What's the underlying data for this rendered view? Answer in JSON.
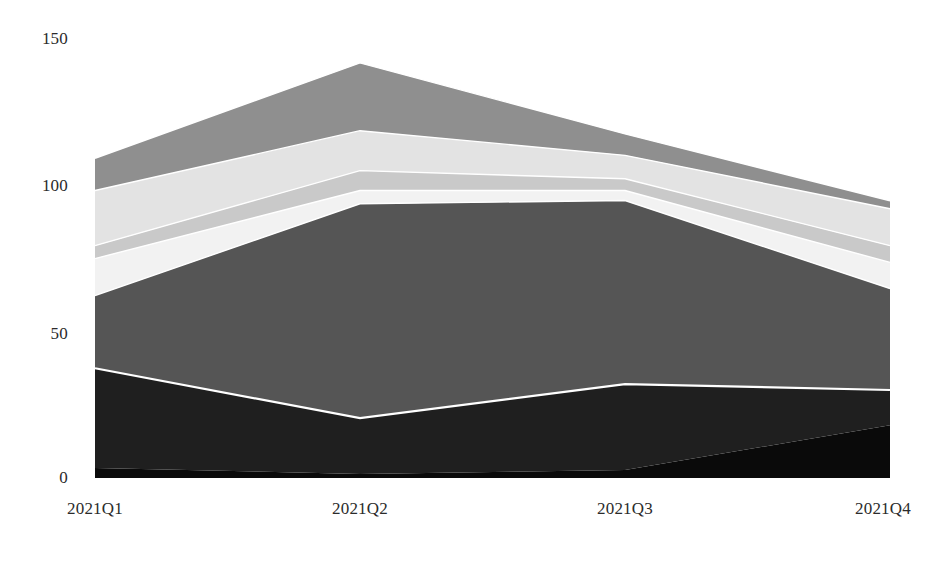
{
  "chart_data": {
    "type": "area",
    "stacked": true,
    "title": "",
    "subtitle": "",
    "xlabel": "",
    "ylabel": "",
    "categories": [
      "2021Q1",
      "2021Q2",
      "2021Q3",
      "2021Q4"
    ],
    "x_tick_labels": [
      "2021Q1",
      "2021Q2",
      "2021Q3",
      "2021Q4"
    ],
    "y_tick_labels": [
      "0",
      "50",
      "100",
      "150"
    ],
    "y_ticks": [
      0,
      50,
      100,
      150
    ],
    "ylim": [
      0,
      150
    ],
    "grid": false,
    "legend": "none",
    "series": [
      {
        "name": "series-1",
        "color": "#0a0a0a",
        "values": [
          3.4,
          1.4,
          2.7,
          18.0
        ]
      },
      {
        "name": "series-2",
        "color": "#1f1f1f",
        "values": [
          34.0,
          19.0,
          29.3,
          12.0
        ]
      },
      {
        "name": "series-3",
        "color": "#555555",
        "values": [
          24.8,
          73.1,
          62.6,
          34.6
        ]
      },
      {
        "name": "series-4",
        "color": "#f2f2f2",
        "values": [
          12.6,
          4.5,
          3.4,
          8.9
        ]
      },
      {
        "name": "series-5",
        "color": "#c9c9c9",
        "values": [
          4.4,
          6.8,
          4.0,
          5.7
        ]
      },
      {
        "name": "series-6",
        "color": "#e3e3e3",
        "values": [
          18.8,
          13.6,
          8.0,
          12.6
        ]
      },
      {
        "name": "series-7",
        "color": "#8f8f8f",
        "values": [
          11.0,
          23.1,
          7.3,
          2.7
        ]
      }
    ],
    "totals": [
      109.0,
      141.5,
      117.3,
      94.5
    ],
    "series_boundaries_cumulative": [
      [
        3.4,
        37.4,
        62.2,
        74.8,
        79.2,
        98.0,
        109.0
      ],
      [
        1.4,
        20.4,
        93.5,
        98.0,
        104.8,
        118.4,
        141.5
      ],
      [
        2.7,
        32.0,
        94.6,
        98.0,
        102.0,
        110.0,
        117.3
      ],
      [
        18.0,
        30.0,
        64.6,
        73.5,
        79.2,
        91.8,
        94.5
      ]
    ],
    "colors": {
      "background": "#ffffff",
      "axis_text": "#2b2b2b",
      "separator_line": "#ffffff"
    }
  },
  "axis": {
    "y_label_0": "0",
    "y_label_50": "50",
    "y_label_100": "100",
    "y_label_150": "150",
    "x_label_q1": "2021Q1",
    "x_label_q2": "2021Q2",
    "x_label_q3": "2021Q3",
    "x_label_q4": "2021Q4"
  }
}
